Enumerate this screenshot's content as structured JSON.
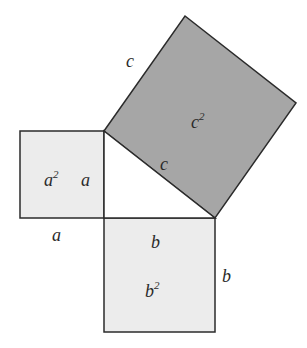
{
  "diagram": {
    "colors": {
      "background": "#ffffff",
      "small_square_fill": "#ececec",
      "hypotenuse_square_fill": "#a6a6a6",
      "stroke": "#2b2b2b"
    },
    "squares": {
      "a_square": {
        "area_label": "a",
        "area_exp": "2",
        "side_label_inner": "a",
        "side_label_below": "a"
      },
      "b_square": {
        "area_label": "b",
        "area_exp": "2",
        "side_label_inner": "b",
        "side_label_right": "b"
      },
      "c_square": {
        "area_label": "c",
        "area_exp": "2",
        "side_label_inner": "c",
        "side_label_outer": "c"
      }
    }
  }
}
